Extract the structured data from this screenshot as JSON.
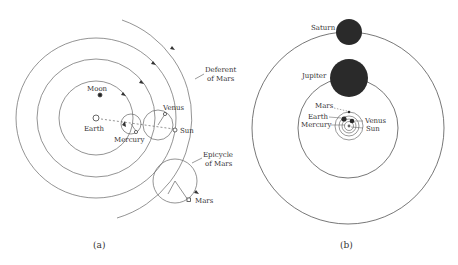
{
  "panels": {
    "a": {
      "caption": "(a)",
      "labels": {
        "moon": "Moon",
        "earth": "Earth",
        "mercury": "Mercury",
        "venus": "Venus",
        "sun": "Sun",
        "deferent_line1": "Deferent",
        "deferent_line2": "of Mars",
        "epicycle_line1": "Epicycle",
        "epicycle_line2": "of Mars",
        "mars": "Mars"
      }
    },
    "b": {
      "caption": "(b)",
      "labels": {
        "saturn": "Saturn",
        "jupiter": "Jupiter",
        "mars": "Mars",
        "earth": "Earth",
        "mercury": "Mercury",
        "venus": "Venus",
        "sun": "Sun"
      }
    }
  },
  "colors": {
    "line": "#555555",
    "planet_fill": "#2a2a2a",
    "background": "#ffffff"
  }
}
